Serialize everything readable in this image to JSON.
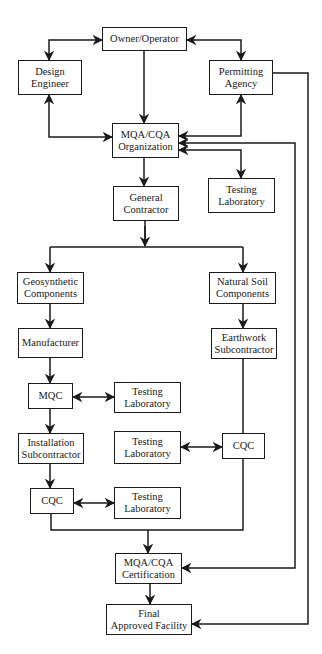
{
  "diagram": {
    "type": "flowchart",
    "colors": {
      "stroke": "#1a1a1a",
      "background": "#ffffff",
      "text": "#1a1a1a"
    },
    "nodes": {
      "owner": {
        "label": "Owner/Operator"
      },
      "design": {
        "label": "Design\nEngineer"
      },
      "permitting": {
        "label": "Permitting\nAgency"
      },
      "mqa_org": {
        "label": "MQA/CQA\nOrganization"
      },
      "testing_lab_1": {
        "label": "Testing\nLaboratory"
      },
      "general_contractor": {
        "label": "General\nContractor"
      },
      "geosynthetic": {
        "label": "Geosynthetic\nComponents"
      },
      "natural_soil": {
        "label": "Natural Soil\nComponents"
      },
      "manufacturer": {
        "label": "Manufacturer"
      },
      "earthwork": {
        "label": "Earthwork\nSubcontractor"
      },
      "mqc": {
        "label": "MQC"
      },
      "testing_lab_2": {
        "label": "Testing\nLaboratory"
      },
      "installation": {
        "label": "Installation\nSubcontractor"
      },
      "testing_lab_3": {
        "label": "Testing\nLaboratory"
      },
      "cqc_right": {
        "label": "CQC"
      },
      "cqc_left": {
        "label": "CQC"
      },
      "testing_lab_4": {
        "label": "Testing\nLaboratory"
      },
      "mqa_cert": {
        "label": "MQA/CQA\nCertification"
      },
      "final": {
        "label": "Final\nApproved Facility"
      }
    },
    "edges": [
      {
        "from": "owner",
        "to": "design",
        "type": "bidirectional"
      },
      {
        "from": "owner",
        "to": "permitting",
        "type": "bidirectional"
      },
      {
        "from": "owner",
        "to": "mqa_org",
        "type": "directed"
      },
      {
        "from": "design",
        "to": "mqa_org",
        "type": "bidirectional"
      },
      {
        "from": "permitting",
        "to": "mqa_org",
        "type": "bidirectional"
      },
      {
        "from": "mqa_org",
        "to": "testing_lab_1",
        "type": "bidirectional"
      },
      {
        "from": "mqa_org",
        "to": "general_contractor",
        "type": "directed"
      },
      {
        "from": "mqa_org",
        "to": "mqa_cert",
        "type": "directed"
      },
      {
        "from": "permitting",
        "to": "final",
        "type": "directed"
      },
      {
        "from": "general_contractor",
        "to": "geosynthetic",
        "type": "directed"
      },
      {
        "from": "general_contractor",
        "to": "natural_soil",
        "type": "directed"
      },
      {
        "from": "geosynthetic",
        "to": "manufacturer",
        "type": "directed"
      },
      {
        "from": "manufacturer",
        "to": "mqc",
        "type": "directed"
      },
      {
        "from": "mqc",
        "to": "testing_lab_2",
        "type": "bidirectional"
      },
      {
        "from": "mqc",
        "to": "installation",
        "type": "directed"
      },
      {
        "from": "installation",
        "to": "cqc_left",
        "type": "directed"
      },
      {
        "from": "cqc_left",
        "to": "testing_lab_4",
        "type": "bidirectional"
      },
      {
        "from": "natural_soil",
        "to": "earthwork",
        "type": "directed"
      },
      {
        "from": "earthwork",
        "to": "cqc_right",
        "type": "line"
      },
      {
        "from": "testing_lab_3",
        "to": "cqc_right",
        "type": "bidirectional"
      },
      {
        "from": "cqc_left",
        "to": "mqa_cert",
        "type": "directed"
      },
      {
        "from": "cqc_right",
        "to": "mqa_cert",
        "type": "directed"
      },
      {
        "from": "mqa_cert",
        "to": "final",
        "type": "directed"
      }
    ]
  }
}
